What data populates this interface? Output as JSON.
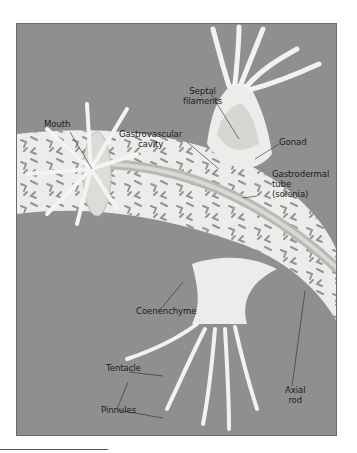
{
  "figure": {
    "colors": {
      "background": "#8f8f8f",
      "tissue": "#ececea",
      "tissue_shadow": "#c9c9c6",
      "solenia": "#8a8a88",
      "label_text": "#1c1c1c"
    },
    "labels": {
      "septal_filaments": "Septal\nfilaments",
      "mouth": "Mouth",
      "gastrovascular_cavity": "Gastrovascular\ncavity",
      "gonad": "Gonad",
      "gastrodermal_tube": "Gastrodermal\ntube\n(solenia)",
      "coenenchyme": "Coenenchyme",
      "tentacle": "Tentacle",
      "pinnules": "Pinnules",
      "axial_rod": "Axial\nrod"
    }
  }
}
